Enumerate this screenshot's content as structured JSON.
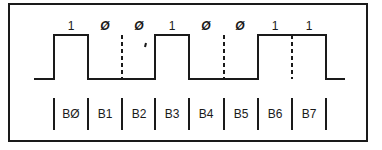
{
  "diagram": {
    "type": "serial-bit-timing",
    "bit_values": [
      "1",
      "Ø",
      "Ø",
      "1",
      "Ø",
      "Ø",
      "1",
      "1"
    ],
    "bit_labels": [
      "BØ",
      "B1",
      "B2",
      "B3",
      "B4",
      "B5",
      "B6",
      "B7"
    ],
    "bit_boundaries_x": [
      54,
      88,
      122,
      155,
      189,
      224,
      258,
      292,
      326
    ],
    "signal_levels": [
      1,
      0,
      0,
      1,
      0,
      0,
      1,
      1
    ],
    "dashed_separators": [
      "B1/B2",
      "B4/B5",
      "B6/B7"
    ],
    "line_color": "#1a1a1a"
  }
}
